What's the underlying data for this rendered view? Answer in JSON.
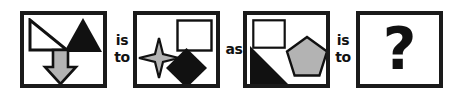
{
  "puzzle": {
    "type": "visual-analogy",
    "connectors": [
      {
        "id": "connector-1",
        "line1": "is",
        "line2": "to",
        "text": "is to"
      },
      {
        "id": "connector-2",
        "line1": "as",
        "line2": "",
        "text": "as"
      },
      {
        "id": "connector-3",
        "line1": "is",
        "line2": "to",
        "text": "is to"
      }
    ],
    "colors": {
      "border": "#1a1a1a",
      "black_fill": "#111111",
      "gray_fill": "#b3b3b3",
      "white_fill": "#ffffff",
      "background": "#ffffff"
    },
    "panels": [
      {
        "index": 1,
        "name": "panel-a",
        "shapes": [
          {
            "name": "right-triangle",
            "fill": "white",
            "outline": "black",
            "position": "top-left"
          },
          {
            "name": "triangle",
            "fill": "black",
            "outline": "none",
            "position": "top-right"
          },
          {
            "name": "down-arrow",
            "fill": "gray",
            "outline": "black",
            "position": "bottom-center"
          }
        ]
      },
      {
        "index": 2,
        "name": "panel-b",
        "shapes": [
          {
            "name": "four-pointed-star",
            "fill": "gray",
            "outline": "black",
            "position": "left-center"
          },
          {
            "name": "square",
            "fill": "white",
            "outline": "black",
            "position": "top-right"
          },
          {
            "name": "diamond",
            "fill": "black",
            "outline": "none",
            "position": "bottom-right"
          }
        ]
      },
      {
        "index": 3,
        "name": "panel-c",
        "shapes": [
          {
            "name": "square",
            "fill": "white",
            "outline": "black",
            "position": "top-left"
          },
          {
            "name": "right-triangle",
            "fill": "black",
            "outline": "none",
            "position": "bottom-left"
          },
          {
            "name": "pentagon",
            "fill": "gray",
            "outline": "black",
            "position": "center-right"
          }
        ]
      },
      {
        "index": 4,
        "name": "panel-answer",
        "answer_glyph": "?",
        "shapes": []
      }
    ]
  }
}
